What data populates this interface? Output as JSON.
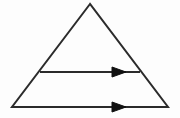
{
  "figure": {
    "background_color": "#fdfdfd",
    "width": 180,
    "height": 118
  },
  "style": {
    "stroke_color": "#2b2b2b",
    "stroke_width": 2,
    "arrow_fill": "#111111"
  },
  "shapes": {
    "triangle": {
      "name": "triangle-outline",
      "apex": {
        "x": 90,
        "y": 4
      },
      "bottom_left": {
        "x": 12,
        "y": 107
      },
      "bottom_right": {
        "x": 168,
        "y": 107
      },
      "points": "90,4 12,107 168,107",
      "fill": "none"
    },
    "arrows": [
      {
        "name": "upper-arrow",
        "y": 72,
        "x_start": 40,
        "x_end": 140,
        "arrowhead_tip_x": 126,
        "arrowhead_base_x": 112,
        "arrowhead_half_height": 5,
        "direction": "right"
      },
      {
        "name": "lower-arrow",
        "y": 107,
        "x_start": 12,
        "x_end": 168,
        "arrowhead_tip_x": 126,
        "arrowhead_base_x": 112,
        "arrowhead_half_height": 5,
        "direction": "right"
      }
    ]
  }
}
